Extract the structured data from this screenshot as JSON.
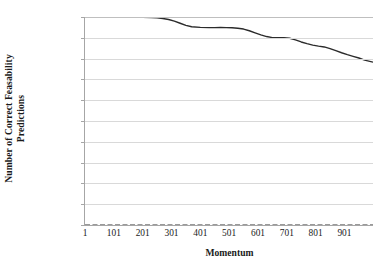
{
  "chart_data": {
    "type": "line",
    "title": "",
    "xlabel": "Momentum",
    "ylabel": "Number of Correct Feasability Predictions",
    "ylabel_lines": [
      "Number of Correct Feasability",
      "Predictions"
    ],
    "xlim": [
      1,
      1000
    ],
    "ylim": [
      0,
      10000
    ],
    "ytick_labels": [
      "10000",
      "9000",
      "8000",
      "7000",
      "6000",
      "5000",
      "4000",
      "3000",
      "2000",
      "1000",
      "0"
    ],
    "ytick_values": [
      10000,
      9000,
      8000,
      7000,
      6000,
      5000,
      4000,
      3000,
      2000,
      1000,
      0
    ],
    "xtick_labels": [
      "1",
      "101",
      "201",
      "301",
      "401",
      "501",
      "601",
      "701",
      "801",
      "901"
    ],
    "xtick_values": [
      1,
      101,
      201,
      301,
      401,
      501,
      601,
      701,
      801,
      901
    ],
    "grid": "horizontal",
    "legend": "none",
    "series": [
      {
        "name": "correct-feasability-predictions",
        "color": "#2b2b2b",
        "style": "solid",
        "width": 1.4,
        "x": [
          1,
          51,
          101,
          151,
          201,
          231,
          251,
          271,
          291,
          311,
          331,
          351,
          371,
          401,
          431,
          451,
          471,
          491,
          511,
          531,
          551,
          571,
          591,
          611,
          631,
          651,
          671,
          691,
          711,
          731,
          751,
          771,
          791,
          811,
          831,
          851,
          871,
          891,
          911,
          931,
          951,
          971,
          1000
        ],
        "values": [
          10000,
          10000,
          10000,
          9990,
          9980,
          9975,
          9960,
          9930,
          9880,
          9800,
          9700,
          9600,
          9530,
          9500,
          9490,
          9490,
          9495,
          9490,
          9480,
          9460,
          9420,
          9340,
          9240,
          9140,
          9060,
          9010,
          9000,
          9010,
          8980,
          8900,
          8800,
          8720,
          8650,
          8600,
          8560,
          8480,
          8380,
          8280,
          8190,
          8110,
          8030,
          7930,
          7830
        ]
      },
      {
        "name": "baseline-zero-series",
        "color": "#9a9a9a",
        "style": "dashed",
        "width": 2.2,
        "x": [
          1,
          1000
        ],
        "values": [
          0,
          0
        ]
      }
    ]
  }
}
